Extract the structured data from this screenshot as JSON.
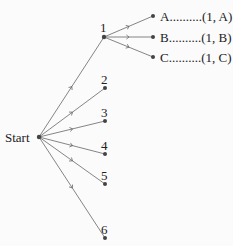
{
  "diagram": {
    "type": "tree",
    "root": {
      "label": "Start"
    },
    "first_level": [
      {
        "label": "1"
      },
      {
        "label": "2"
      },
      {
        "label": "3"
      },
      {
        "label": "4"
      },
      {
        "label": "5"
      },
      {
        "label": "6"
      }
    ],
    "second_level_from_1": [
      {
        "label": "A",
        "outcome": "A..........(1, A)"
      },
      {
        "label": "B",
        "outcome": "B..........(1, B)"
      },
      {
        "label": "C",
        "outcome": "C..........(1, C)"
      }
    ]
  }
}
